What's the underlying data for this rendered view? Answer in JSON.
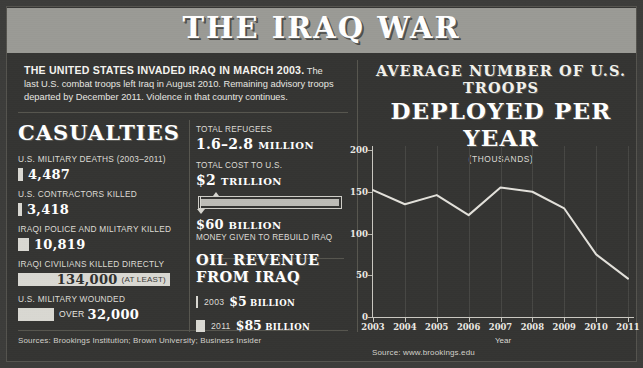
{
  "header": {
    "title": "THE IRAQ WAR"
  },
  "intro": {
    "lead": "THE UNITED STATES INVADED IRAQ IN MARCH 2003.",
    "body": " The last U.S. combat troops left Iraq in August 2010. Remaining advisory troops departed by December 2011. Violence in that country continues."
  },
  "casualties": {
    "heading": "CASUALTIES",
    "items": [
      {
        "label": "U.S. MILITARY DEATHS (2003–2011)",
        "value": "4,487",
        "note": "",
        "bar_width": 5,
        "value_on_bar": false
      },
      {
        "label": "U.S. CONTRACTORS KILLED",
        "value": "3,418",
        "note": "",
        "bar_width": 4,
        "value_on_bar": false
      },
      {
        "label": "IRAQI POLICE AND MILITARY KILLED",
        "value": "10,819",
        "note": "",
        "bar_width": 11,
        "value_on_bar": false
      },
      {
        "label": "IRAQI CIVILIANS KILLED DIRECTLY",
        "value": "134,000",
        "note": "(AT LEAST)",
        "bar_width": 152,
        "value_on_bar": true
      },
      {
        "label": "U.S. MILITARY WOUNDED",
        "value": "32,000",
        "note": "OVER",
        "bar_width": 36,
        "value_on_bar": false
      }
    ]
  },
  "middle": {
    "refugees_label": "TOTAL REFUGEES",
    "refugees_value": "1.6–2.8",
    "refugees_unit": "MILLION",
    "cost_label": "TOTAL COST TO U.S.",
    "cost_value": "$2",
    "cost_unit": "TRILLION",
    "rebuild_value": "$60",
    "rebuild_unit": "BILLION",
    "rebuild_note": "MONEY GIVEN TO REBUILD IRAQ",
    "oil_heading": "OIL REVENUE FROM IRAQ",
    "oil_rows": [
      {
        "year": "2003",
        "value": "$5",
        "unit": "BILLION",
        "bar_width": 2
      },
      {
        "year": "2011",
        "value": "$85",
        "unit": "BILLION",
        "bar_width": 9
      }
    ]
  },
  "chart_panel": {
    "title_line1": "AVERAGE NUMBER OF U.S. TROOPS",
    "title_line2": "DEPLOYED PER YEAR",
    "title_line3": "(THOUSANDS)"
  },
  "chart_data": {
    "type": "line",
    "title": "AVERAGE NUMBER OF U.S. TROOPS DEPLOYED PER YEAR",
    "subtitle": "(THOUSANDS)",
    "xlabel": "Year",
    "ylabel": "",
    "categories": [
      "2003",
      "2004",
      "2005",
      "2006",
      "2007",
      "2008",
      "2009",
      "2010",
      "2011"
    ],
    "values": [
      152,
      135,
      146,
      122,
      155,
      150,
      130,
      75,
      46
    ],
    "ylim": [
      0,
      200
    ],
    "yticks": [
      0,
      50,
      100,
      150,
      200
    ],
    "grid": true,
    "legend": "none",
    "line_color": "#e3e1db"
  },
  "sources": {
    "left": "Sources: Brookings Institution; Brown University; Business Insider",
    "right": "Source: www.brookings.edu"
  }
}
